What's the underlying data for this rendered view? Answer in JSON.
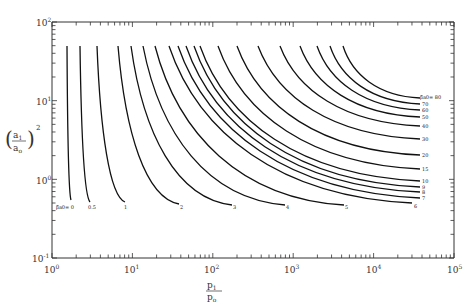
{
  "chart_data": {
    "type": "line",
    "title": "",
    "xlabel": "p1/p0",
    "ylabel": "(a1/a0)^2",
    "xscale": "log",
    "yscale": "log",
    "xlim": [
      1,
      100000
    ],
    "ylim": [
      0.1,
      100
    ],
    "grid": false,
    "legend": "inline labels at curve ends",
    "x_ticks": [
      "10^0",
      "10^1",
      "10^2",
      "10^3",
      "10^4",
      "10^5"
    ],
    "y_ticks": [
      "10^-1",
      "10^0",
      "10^1",
      "10^2"
    ],
    "parameter_name": "β̂a0",
    "series": [
      {
        "name": "0",
        "label_px": [
          56,
          209
        ],
        "start_px": [
          67,
          46
        ],
        "end_px": [
          71,
          200
        ]
      },
      {
        "name": "0.5",
        "label_px": [
          88,
          209
        ],
        "start_px": [
          80,
          46
        ],
        "end_px": [
          90,
          202
        ]
      },
      {
        "name": "1",
        "label_px": [
          124,
          209
        ],
        "start_px": [
          97,
          46
        ],
        "end_px": [
          125,
          202
        ]
      },
      {
        "name": "2",
        "label_px": [
          180,
          209
        ],
        "start_px": [
          118,
          46
        ],
        "end_px": [
          179,
          204
        ]
      },
      {
        "name": "3",
        "label_px": [
          233,
          209
        ],
        "start_px": [
          131,
          46
        ],
        "end_px": [
          232,
          205
        ]
      },
      {
        "name": "4",
        "label_px": [
          286,
          209
        ],
        "start_px": [
          143,
          46
        ],
        "end_px": [
          285,
          205
        ]
      },
      {
        "name": "5",
        "label_px": [
          345,
          209
        ],
        "start_px": [
          155,
          46
        ],
        "end_px": [
          344,
          205
        ]
      },
      {
        "name": "6",
        "label_px": [
          414,
          208
        ],
        "start_px": [
          169,
          46
        ],
        "end_px": [
          412,
          203
        ]
      },
      {
        "name": "7",
        "label_px": [
          422,
          200
        ],
        "start_px": [
          178,
          46
        ],
        "end_px": [
          420,
          198
        ]
      },
      {
        "name": "8",
        "label_px": [
          422,
          194
        ],
        "start_px": [
          186,
          46
        ],
        "end_px": [
          420,
          192
        ]
      },
      {
        "name": "9",
        "label_px": [
          422,
          189
        ],
        "start_px": [
          194,
          46
        ],
        "end_px": [
          420,
          187
        ]
      },
      {
        "name": "10",
        "label_px": [
          422,
          183
        ],
        "start_px": [
          200,
          46
        ],
        "end_px": [
          420,
          181
        ]
      },
      {
        "name": "15",
        "label_px": [
          422,
          171
        ],
        "start_px": [
          218,
          46
        ],
        "end_px": [
          420,
          169
        ]
      },
      {
        "name": "20",
        "label_px": [
          422,
          157
        ],
        "start_px": [
          237,
          46
        ],
        "end_px": [
          420,
          155
        ]
      },
      {
        "name": "30",
        "label_px": [
          422,
          141
        ],
        "start_px": [
          258,
          46
        ],
        "end_px": [
          420,
          139
        ]
      },
      {
        "name": "40",
        "label_px": [
          422,
          128
        ],
        "start_px": [
          280,
          46
        ],
        "end_px": [
          420,
          126
        ]
      },
      {
        "name": "50",
        "label_px": [
          422,
          119
        ],
        "start_px": [
          300,
          46
        ],
        "end_px": [
          420,
          117
        ]
      },
      {
        "name": "60",
        "label_px": [
          422,
          112
        ],
        "start_px": [
          317,
          46
        ],
        "end_px": [
          420,
          110
        ]
      },
      {
        "name": "70",
        "label_px": [
          422,
          106
        ],
        "start_px": [
          330,
          46
        ],
        "end_px": [
          420,
          104
        ]
      },
      {
        "name": "80",
        "label_px": [
          428,
          99
        ],
        "start_px": [
          343,
          46
        ],
        "end_px": [
          420,
          98
        ]
      }
    ],
    "approx_values": {
      "curve_top_y": 50,
      "note": "each curve starts at (a1/a0)^2 ≈ 50 and decreases as p1/p0 increases; labeled parameter β̂a0 = 0, 0.5, 1, 2 ... 80",
      "end_points_xy": [
        {
          "param": "0",
          "x": 1.5,
          "y": 0.55
        },
        {
          "param": "0.5",
          "x": 2.9,
          "y": 0.5
        },
        {
          "param": "1",
          "x": 8,
          "y": 0.5
        },
        {
          "param": "2",
          "x": 40,
          "y": 0.47
        },
        {
          "param": "3",
          "x": 180,
          "y": 0.45
        },
        {
          "param": "4",
          "x": 800,
          "y": 0.45
        },
        {
          "param": "5",
          "x": 4500,
          "y": 0.45
        },
        {
          "param": "6",
          "x": 32000,
          "y": 0.48
        },
        {
          "param": "7",
          "x": 37000,
          "y": 0.57
        },
        {
          "param": "8",
          "x": 37000,
          "y": 0.68
        },
        {
          "param": "9",
          "x": 37000,
          "y": 0.78
        },
        {
          "param": "10",
          "x": 37000,
          "y": 0.92
        },
        {
          "param": "15",
          "x": 37000,
          "y": 1.3
        },
        {
          "param": "20",
          "x": 37000,
          "y": 1.95
        },
        {
          "param": "30",
          "x": 37000,
          "y": 3.1
        },
        {
          "param": "40",
          "x": 37000,
          "y": 4.5
        },
        {
          "param": "50",
          "x": 37000,
          "y": 5.8
        },
        {
          "param": "60",
          "x": 37000,
          "y": 7.2
        },
        {
          "param": "70",
          "x": 37000,
          "y": 8.5
        },
        {
          "param": "80",
          "x": 37000,
          "y": 10
        }
      ]
    }
  },
  "axes": {
    "x_title_num": "p",
    "x_title_num_sub": "1",
    "x_title_den": "p",
    "x_title_den_sub": "o",
    "y_title_num": "a",
    "y_title_num_sub": "1",
    "y_title_den": "a",
    "y_title_den_sub": "o",
    "y_title_exp": "2",
    "x_tick_base": "10",
    "x_tick_exps": [
      "0",
      "1",
      "2",
      "3",
      "4",
      "5"
    ],
    "y_tick_base": "10",
    "y_tick_exps": [
      "2",
      "1",
      "0",
      "-1"
    ]
  },
  "labels": {
    "param_prefix": "β̂",
    "param_sub": "a0",
    "zero_label": "= 0",
    "eighty_label": "= 80"
  }
}
